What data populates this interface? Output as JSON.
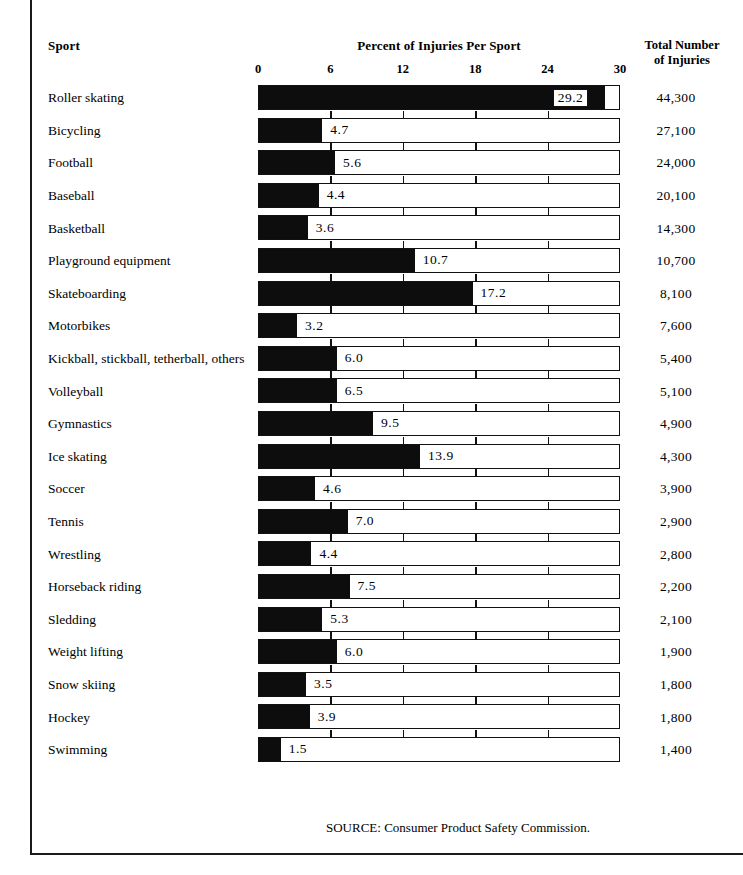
{
  "header": {
    "sport_label": "Sport",
    "chart_title": "Percent of Injuries Per Sport",
    "total_label_line1": "Total Number",
    "total_label_line2": "of Injuries"
  },
  "source_note": "SOURCE: Consumer Product Safety Commission.",
  "colors": {
    "bar_fill": "#0d0d0d",
    "frame": "#111111",
    "background": "#ffffff",
    "text": "#000000"
  },
  "chart_data": {
    "type": "bar",
    "orientation": "horizontal",
    "title": "Percent of Injuries Per Sport",
    "xlabel": "Percent of Injuries Per Sport",
    "ylabel": "Sport",
    "xlim": [
      0,
      30
    ],
    "xticks": [
      0,
      6,
      12,
      18,
      24,
      30
    ],
    "tick_labels": [
      "0",
      "6",
      "12",
      "18",
      "24",
      "30"
    ],
    "grid": true,
    "legend": false,
    "categories": [
      "Roller skating",
      "Bicycling",
      "Football",
      "Baseball",
      "Basketball",
      "Playground equipment",
      "Skateboarding",
      "Motorbikes",
      "Kickball, stickball, tetherball, others",
      "Volleyball",
      "Gymnastics",
      "Ice skating",
      "Soccer",
      "Tennis",
      "Wrestling",
      "Horseback riding",
      "Sledding",
      "Weight lifting",
      "Snow skiing",
      "Hockey",
      "Swimming"
    ],
    "values": [
      29.2,
      4.7,
      5.6,
      4.4,
      3.6,
      10.7,
      17.2,
      3.2,
      6.0,
      6.5,
      9.5,
      13.9,
      4.6,
      7.0,
      4.4,
      7.5,
      5.3,
      6.0,
      3.5,
      3.9,
      1.5
    ],
    "value_labels": [
      "29.2",
      "4.7",
      "5.6",
      "4.4",
      "3.6",
      "10.7",
      "17.2",
      "3.2",
      "6.0",
      "6.5",
      "9.5",
      "13.9",
      "4.6",
      "7.0",
      "4.4",
      "7.5",
      "5.3",
      "6.0",
      "3.5",
      "3.9",
      "1.5"
    ],
    "secondary_series": {
      "name": "Total Number of Injuries",
      "values": [
        44300,
        27100,
        24000,
        20100,
        14300,
        10700,
        8100,
        7600,
        5400,
        5100,
        4900,
        4300,
        3900,
        2900,
        2800,
        2200,
        2100,
        1900,
        1800,
        1800,
        1400
      ],
      "labels": [
        "44,300",
        "27,100",
        "24,000",
        "20,100",
        "14,300",
        "10,700",
        "8,100",
        "7,600",
        "5,400",
        "5,100",
        "4,900",
        "4,300",
        "3,900",
        "2,900",
        "2,800",
        "2,200",
        "2,100",
        "1,900",
        "1,800",
        "1,800",
        "1,400"
      ]
    },
    "drawn_bar_fractions": [
      0.955,
      0.175,
      0.21,
      0.165,
      0.135,
      0.43,
      0.59,
      0.105,
      0.215,
      0.215,
      0.315,
      0.445,
      0.155,
      0.245,
      0.145,
      0.25,
      0.175,
      0.215,
      0.13,
      0.14,
      0.06
    ]
  }
}
